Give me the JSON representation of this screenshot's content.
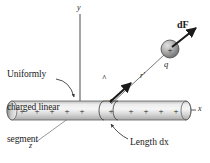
{
  "figure": {
    "background_color": "#ffffff",
    "ink_color": "#1a1a1a",
    "rod_fill_light": "#f0f0f0",
    "rod_fill_mid": "#d0d0d0",
    "rod_fill_dark": "#9a9a9a",
    "sphere_fill_light": "#d8d8d8",
    "sphere_fill_dark": "#6e6e6e"
  },
  "labels": {
    "uniform_segment_line1": "Uniformly",
    "uniform_segment_line2": "charged linear",
    "uniform_segment_line3": "segment",
    "length_dx": "Length dx",
    "force_vector": "dF",
    "charge": "q",
    "distance_vector": "r'",
    "unit_vector": "r'",
    "unit_vector_hat": "^"
  },
  "axes": {
    "x": "x",
    "y": "y",
    "z": "z"
  },
  "rod": {
    "charge_symbol": "+",
    "left_charge_count": 5,
    "segment_charge_count": 1,
    "right_charge_count": 5,
    "charge_positions_left": [
      22,
      37,
      52,
      67,
      82
    ],
    "charge_position_segment": [
      110
    ],
    "charge_positions_right": [
      131,
      146,
      161,
      176,
      191
    ]
  },
  "sphere": {
    "charge_symbol": "+",
    "center_x": 170,
    "center_y": 49,
    "radius": 9
  }
}
